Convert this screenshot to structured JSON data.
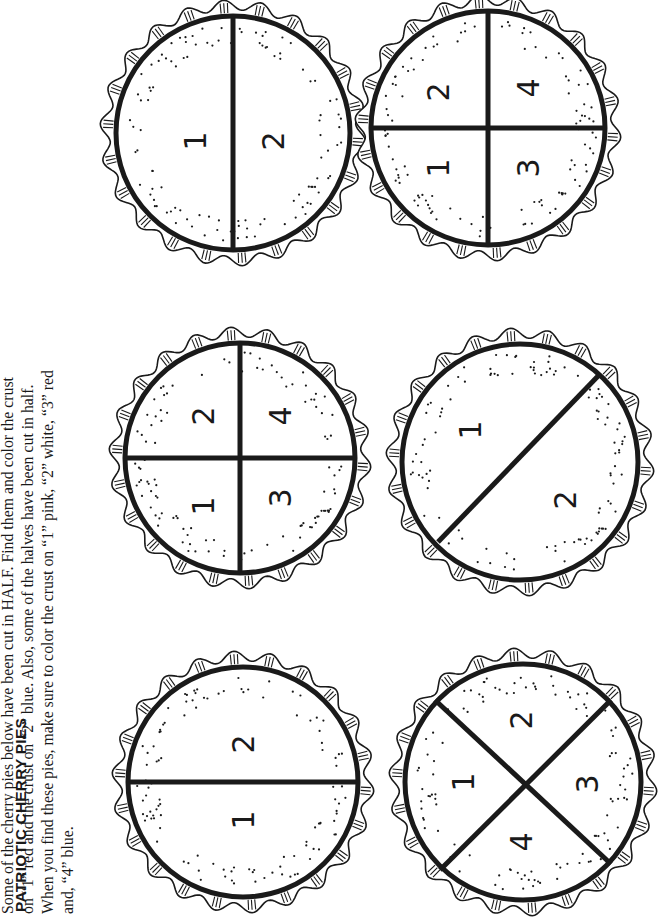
{
  "page": {
    "title": "PATRIOTIC CHERRY PIES",
    "instructions_lines": [
      "Some of the cherry pies below have been cut in HALF. Find them and color the crust",
      "on “1” red and the crust on “2” blue. Also, some of the halves have been cut in half.",
      "When you find these pies, make sure to color the crust on “1” pink, “2” white, “3” red",
      "and, “4” blue."
    ]
  },
  "pies": [
    {
      "id": "pie-a",
      "cut": "halves-straight",
      "labels": [
        "1",
        "2"
      ]
    },
    {
      "id": "pie-b",
      "cut": "quarters-cross",
      "labels": [
        "1",
        "2",
        "3",
        "4"
      ]
    },
    {
      "id": "pie-c",
      "cut": "halves-straight",
      "labels": [
        "1",
        "2"
      ]
    },
    {
      "id": "pie-d",
      "cut": "quarters-diagonal",
      "labels": [
        "1",
        "2",
        "3",
        "4"
      ]
    },
    {
      "id": "pie-e",
      "cut": "halves-diagonal",
      "labels": [
        "1",
        "2"
      ]
    },
    {
      "id": "pie-f",
      "cut": "quarters-cross",
      "labels": [
        "1",
        "2",
        "3",
        "4"
      ]
    }
  ],
  "colors": {
    "ink": "#1a1a1a",
    "paper": "#ffffff"
  }
}
